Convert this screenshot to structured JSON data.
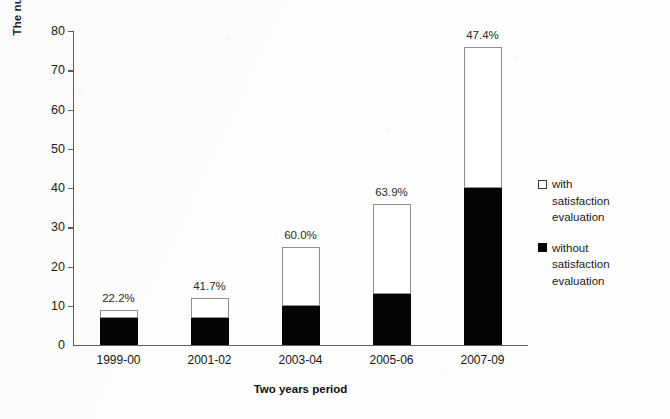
{
  "chart_data": {
    "type": "bar",
    "subtype": "stacked-bar",
    "title": "",
    "subtitle": "",
    "xlabel": "Two years period",
    "ylabel": "The number of telemedicine applications",
    "categories": [
      "1999-00",
      "2001-02",
      "2003-04",
      "2005-06",
      "2007-09"
    ],
    "series": [
      {
        "name": "without satisfaction evaluation",
        "color": "#000000",
        "values": [
          7,
          7,
          10,
          13,
          40
        ]
      },
      {
        "name": "with satisfaction evaluation",
        "color": "#ffffff",
        "values": [
          2,
          5,
          15,
          23,
          36
        ]
      }
    ],
    "totals": [
      9,
      12,
      25,
      36,
      76
    ],
    "annotations": [
      "22.2%",
      "41.7%",
      "60.0%",
      "63.9%",
      "47.4%"
    ],
    "ylim": [
      0,
      80
    ],
    "yticks": [
      0,
      10,
      20,
      30,
      40,
      50,
      60,
      70,
      80
    ],
    "ytick_labels": [
      "0",
      "10",
      "20",
      "30",
      "40",
      "50",
      "60",
      "70",
      "80"
    ],
    "grid": false,
    "legend_position": "right"
  },
  "legend": {
    "entries": [
      {
        "label": "with\nsatisfaction\nevaluation",
        "swatch": "hollow"
      },
      {
        "label": "without\nsatisfaction\nevaluation",
        "swatch": "solid"
      }
    ]
  }
}
